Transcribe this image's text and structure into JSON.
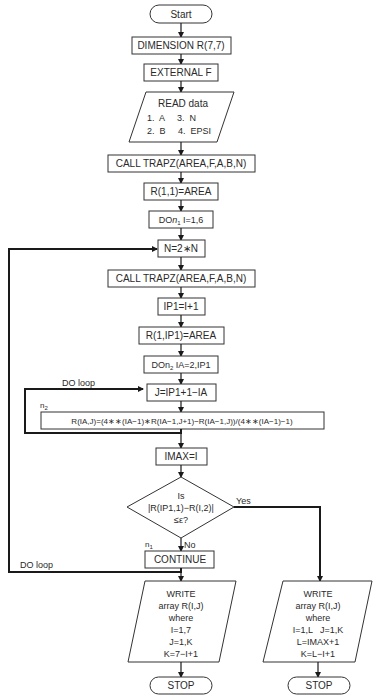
{
  "nodes": {
    "start": "Start",
    "dimension": "DIMENSION R(7,7)",
    "external": "EXTERNAL F",
    "read_title": "READ data",
    "read_line1": "1.  A     3.  N",
    "read_line2": "2.  B     4.  EPSI",
    "call1": "CALL TRAPZ(AREA,F,A,B,N)",
    "r11": "R(1,1)=AREA",
    "do_n1_prefix": "DO",
    "do_n1_var": "n",
    "do_n1_sub": "1",
    "do_n1_rest": " I=1,6",
    "n2n": "N=2∗N",
    "call2": "CALL TRAPZ(AREA,F,A,B,N)",
    "ip1": "IP1=I+1",
    "r1ip1": "R(1,IP1)=AREA",
    "do_n2_prefix": "DO",
    "do_n2_var": "n",
    "do_n2_sub": "2",
    "do_n2_rest": " IA=2,IP1",
    "j_assign": "J=IP1+1−IA",
    "richardson": "R(IA,J)=(4∗∗(IA−1)∗R(IA−1,J+1)−R(IA−1,J))/(4∗∗(IA−1)−1)",
    "imax": "IMAX=I",
    "decision_line1": "Is",
    "decision_line2": "|R(IP1,1)−R(I,2)|",
    "decision_line3": "≤ε?",
    "continue": "CONTINUE",
    "write_left": [
      "WRITE",
      "array R(I,J)",
      "where",
      "I=1,7",
      "J=1,K",
      "K=7−I+1"
    ],
    "write_right": [
      "WRITE",
      "array R(I,J)",
      "where",
      "I=1,L   J=1,K",
      "L=IMAX+1",
      "K=L−I+1"
    ],
    "stop_left": "STOP",
    "stop_right": "STOP"
  },
  "labels": {
    "do_loop_inner": "DO loop",
    "n2_label_var": "n",
    "n2_label_sub": "2",
    "yes": "Yes",
    "no": "No",
    "n1_label_var": "n",
    "n1_label_sub": "1",
    "do_loop_outer": "DO loop"
  }
}
